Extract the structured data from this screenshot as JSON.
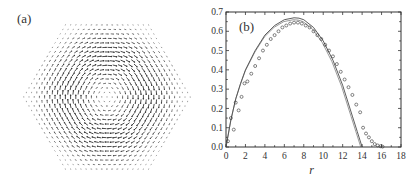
{
  "panel_a": {
    "label": "(a)",
    "description": "Hexagonal lattice of arrows forming a vortex (counterclockwise swirl) texture",
    "shape": "hexagon",
    "arrow_color": "#333333"
  },
  "panel_b": {
    "label": "(b)"
  },
  "chart_data": [
    {
      "type": "vector-field",
      "panel": "(a)",
      "title": "",
      "description": "Spin/arrow vortex on a hexagonal lattice; arrows tangential around center, magnitude small at center and at edges",
      "lattice": "hexagonal",
      "rings": 16
    },
    {
      "type": "scatter",
      "panel": "(b)",
      "title": "",
      "xlabel": "r",
      "ylabel": "",
      "xlim": [
        0,
        18
      ],
      "ylim": [
        0.0,
        0.7
      ],
      "xticks": [
        0,
        2,
        4,
        6,
        8,
        10,
        12,
        14,
        16,
        18
      ],
      "yticks": [
        0.0,
        0.1,
        0.2,
        0.3,
        0.4,
        0.5,
        0.6,
        0.7
      ],
      "xtick_labels": [
        "0",
        "2",
        "4",
        "6",
        "8",
        "10",
        "12",
        "14",
        "16",
        "18"
      ],
      "ytick_labels": [
        "0.0",
        "0.1",
        "0.2",
        "0.3",
        "0.4",
        "0.5",
        "0.6",
        "0.7"
      ],
      "grid": false,
      "legend": null,
      "series": [
        {
          "name": "theory curve",
          "style": "line",
          "x": [
            0,
            0.5,
            1,
            1.5,
            2,
            3,
            4,
            5,
            6,
            7,
            7.5,
            8,
            9,
            10,
            11,
            12,
            13,
            13.5,
            14
          ],
          "y": [
            0.0,
            0.14,
            0.25,
            0.33,
            0.4,
            0.5,
            0.58,
            0.63,
            0.66,
            0.67,
            0.668,
            0.66,
            0.62,
            0.55,
            0.45,
            0.32,
            0.16,
            0.08,
            0.0
          ]
        },
        {
          "name": "simulation data",
          "style": "open-circle",
          "x": [
            0.2,
            0.5,
            0.8,
            1.0,
            1.3,
            1.6,
            1.9,
            2.2,
            2.6,
            3.0,
            3.4,
            3.8,
            4.2,
            4.6,
            5.0,
            5.4,
            5.8,
            6.2,
            6.6,
            7.0,
            7.4,
            7.8,
            8.2,
            8.6,
            9.0,
            9.4,
            9.8,
            10.2,
            10.6,
            11.0,
            11.4,
            11.8,
            12.2,
            12.6,
            13.0,
            13.4,
            13.8,
            14.1,
            14.4,
            14.7,
            15.0,
            15.3,
            15.6,
            15.9,
            16.1
          ],
          "y": [
            0.03,
            0.15,
            0.09,
            0.23,
            0.19,
            0.26,
            0.33,
            0.34,
            0.38,
            0.42,
            0.46,
            0.5,
            0.53,
            0.56,
            0.58,
            0.6,
            0.62,
            0.63,
            0.64,
            0.645,
            0.645,
            0.64,
            0.63,
            0.62,
            0.6,
            0.58,
            0.56,
            0.53,
            0.5,
            0.47,
            0.43,
            0.39,
            0.35,
            0.31,
            0.27,
            0.22,
            0.18,
            0.1,
            0.07,
            0.05,
            0.03,
            0.015,
            0.008,
            0.004,
            0.002
          ]
        }
      ]
    }
  ]
}
